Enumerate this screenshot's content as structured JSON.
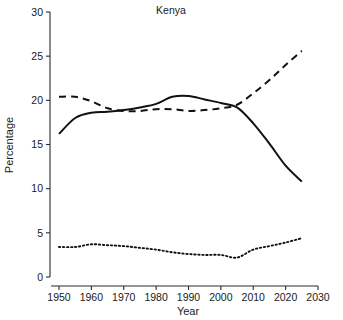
{
  "chart_data": {
    "type": "line",
    "title": "Kenya",
    "xlabel": "Year",
    "ylabel": "Percentage",
    "xlim": [
      1945,
      2032
    ],
    "ylim": [
      0,
      30
    ],
    "xticks": [
      1950,
      1960,
      1970,
      1980,
      1990,
      2000,
      2010,
      2020,
      2030
    ],
    "yticks": [
      0,
      5,
      10,
      15,
      20,
      25,
      30
    ],
    "grid": false,
    "legend": "none",
    "series": [
      {
        "name": "solid",
        "style": "solid",
        "color": "#111111",
        "x": [
          1950,
          1955,
          1960,
          1965,
          1970,
          1975,
          1980,
          1985,
          1990,
          1995,
          2000,
          2005,
          2010,
          2015,
          2020,
          2025
        ],
        "values": [
          16.2,
          18.0,
          18.6,
          18.7,
          18.9,
          19.2,
          19.6,
          20.4,
          20.5,
          20.1,
          19.7,
          19.2,
          17.4,
          15.1,
          12.6,
          10.8
        ]
      },
      {
        "name": "dashed",
        "style": "dashed",
        "color": "#111111",
        "x": [
          1950,
          1955,
          1960,
          1965,
          1970,
          1975,
          1980,
          1985,
          1990,
          1995,
          2000,
          2005,
          2010,
          2015,
          2020,
          2025
        ],
        "values": [
          20.4,
          20.4,
          19.9,
          19.1,
          18.8,
          18.8,
          19.0,
          19.0,
          18.8,
          18.9,
          19.1,
          19.5,
          20.8,
          22.3,
          24.0,
          25.6
        ]
      },
      {
        "name": "dotted",
        "style": "dotted",
        "color": "#111111",
        "x": [
          1950,
          1955,
          1960,
          1965,
          1970,
          1975,
          1980,
          1985,
          1990,
          1995,
          2000,
          2005,
          2010,
          2015,
          2020,
          2025
        ],
        "values": [
          3.4,
          3.4,
          3.7,
          3.6,
          3.5,
          3.3,
          3.1,
          2.8,
          2.6,
          2.5,
          2.5,
          2.2,
          3.1,
          3.5,
          3.9,
          4.4
        ]
      }
    ]
  }
}
